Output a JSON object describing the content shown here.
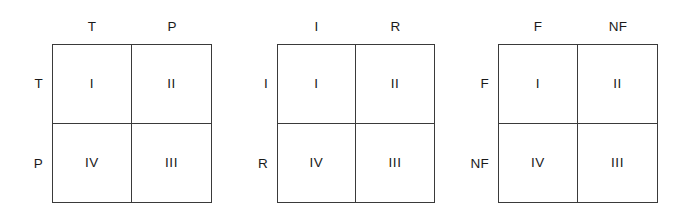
{
  "figure": {
    "type": "2x2-matrix-diagram",
    "background_color": "#ffffff",
    "line_color": "#3a3a3a",
    "text_color": "#1a1a1a",
    "matrices": [
      {
        "name": "matrix-1",
        "column_headers": [
          "T",
          "P"
        ],
        "row_labels": [
          "T",
          "P"
        ],
        "quadrants": {
          "top_left": "I",
          "top_right": "II",
          "bottom_left": "IV",
          "bottom_right": "III"
        }
      },
      {
        "name": "matrix-2",
        "column_headers": [
          "I",
          "R"
        ],
        "row_labels": [
          "I",
          "R"
        ],
        "quadrants": {
          "top_left": "I",
          "top_right": "II",
          "bottom_left": "IV",
          "bottom_right": "III"
        }
      },
      {
        "name": "matrix-3",
        "column_headers": [
          "F",
          "NF"
        ],
        "row_labels": [
          "F",
          "NF"
        ],
        "quadrants": {
          "top_left": "I",
          "top_right": "II",
          "bottom_left": "IV",
          "bottom_right": "III"
        }
      }
    ]
  }
}
